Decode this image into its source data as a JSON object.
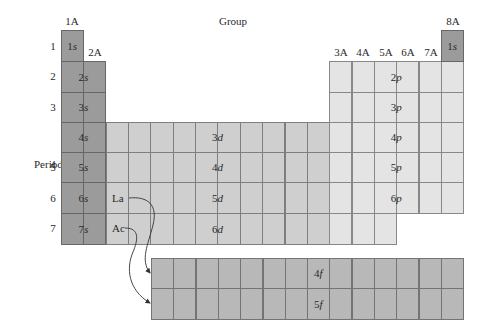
{
  "title": "Group",
  "period_label": "Period",
  "groups": {
    "g1A": "1A",
    "g2A": "2A",
    "g3A": "3A",
    "g4A": "4A",
    "g5A": "5A",
    "g6A": "6A",
    "g7A": "7A",
    "g8A": "8A"
  },
  "periods": [
    "1",
    "2",
    "3",
    "4",
    "5",
    "6",
    "7"
  ],
  "s_block": {
    "color": "#9b9b9b",
    "labels": [
      {
        "n": "1",
        "o": "s"
      },
      {
        "n": "2",
        "o": "s"
      },
      {
        "n": "3",
        "o": "s"
      },
      {
        "n": "4",
        "o": "s"
      },
      {
        "n": "5",
        "o": "s"
      },
      {
        "n": "6",
        "o": "s"
      },
      {
        "n": "7",
        "o": "s"
      }
    ],
    "he_label": {
      "n": "1",
      "o": "s"
    }
  },
  "d_block": {
    "color": "#cfcfcf",
    "labels": [
      {
        "n": "3",
        "o": "d"
      },
      {
        "n": "4",
        "o": "d"
      },
      {
        "n": "5",
        "o": "d"
      },
      {
        "n": "6",
        "o": "d"
      }
    ],
    "lanthanum": "La",
    "actinium": "Ac"
  },
  "p_block": {
    "color": "#e4e4e4",
    "labels": [
      {
        "n": "2",
        "o": "p"
      },
      {
        "n": "3",
        "o": "p"
      },
      {
        "n": "4",
        "o": "p"
      },
      {
        "n": "5",
        "o": "p"
      },
      {
        "n": "6",
        "o": "p"
      }
    ]
  },
  "f_block": {
    "color": "#b8b8b8",
    "labels": [
      {
        "n": "4",
        "o": "f"
      },
      {
        "n": "5",
        "o": "f"
      }
    ]
  }
}
